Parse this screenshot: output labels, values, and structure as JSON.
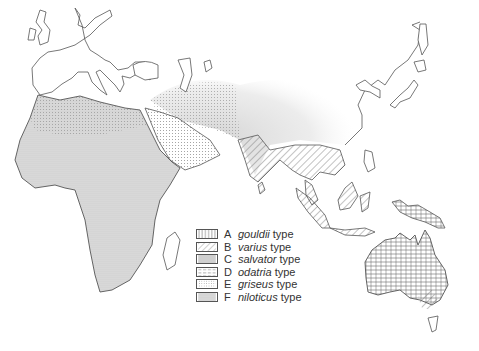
{
  "map": {
    "title": "",
    "regions_shown": [
      "Europe",
      "Africa",
      "Asia",
      "Indonesia",
      "New Guinea",
      "Australia",
      "Japan"
    ],
    "colors": {
      "outline": "#555555",
      "fill_pattern": "#777777",
      "background": "#ffffff"
    }
  },
  "legend": {
    "items": [
      {
        "letter": "A",
        "name": "gouldii",
        "suffix": "type",
        "pattern": "vertical-lines"
      },
      {
        "letter": "B",
        "name": "varius",
        "suffix": "type",
        "pattern": "diagonal-lines"
      },
      {
        "letter": "C",
        "name": "salvator",
        "suffix": "type",
        "pattern": "solid-grey"
      },
      {
        "letter": "D",
        "name": "odatria",
        "suffix": "type",
        "pattern": "dashed-lines"
      },
      {
        "letter": "E",
        "name": "griseus",
        "suffix": "type",
        "pattern": "dots"
      },
      {
        "letter": "F",
        "name": "niloticus",
        "suffix": "type",
        "pattern": "stipple"
      }
    ]
  }
}
